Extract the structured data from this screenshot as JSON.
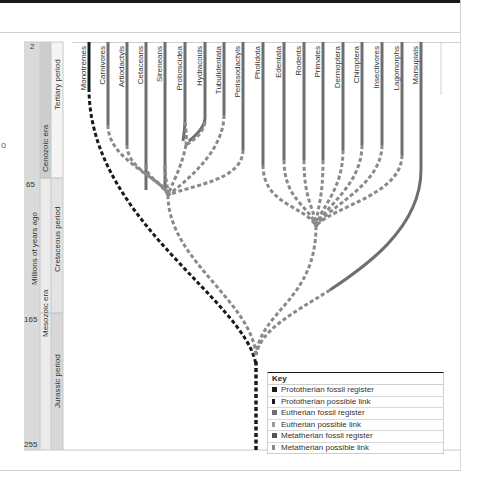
{
  "figure": {
    "side_mark": "o",
    "timeline": {
      "axis_title": "Millions of years ago",
      "ticks": [
        "2",
        "65",
        "165",
        "255"
      ],
      "eras": [
        {
          "name": "Cenozoic era"
        },
        {
          "name": "Mesozoic era"
        }
      ],
      "periods": [
        {
          "name": "Tertiary period"
        },
        {
          "name": "Cretaceous period"
        },
        {
          "name": "Jurassic period"
        }
      ]
    },
    "taxa": [
      "Monotremes",
      "Carnivores",
      "Artiodactyls",
      "Cetaceans",
      "Sireneans",
      "Proboscidea",
      "Hydracoids",
      "Tubulidentata",
      "Perissodactyls",
      "Pholidota",
      "Edentata",
      "Rodents",
      "Primates",
      "Dermoptera",
      "Chiroptera",
      "Insectivores",
      "Lagomorphs",
      "Marsupials"
    ],
    "colors": {
      "prototherian": "#1a1a1a",
      "eutherian": "#6e6e6e",
      "eutherian_link": "#8a8a8a",
      "metatherian": "#6e6e6e",
      "era_band": "#d6d6d6",
      "period_band": "#e9e9e9"
    },
    "key": {
      "title": "Key",
      "items": [
        {
          "label": "Prototherian fossil register",
          "color": "#1a1a1a"
        },
        {
          "label": "Prototherian possible link",
          "color": "#1a1a1a"
        },
        {
          "label": "Eutherian fossil register",
          "color": "#6e6e6e"
        },
        {
          "label": "Eutherian possible link",
          "color": "#9a9a9a"
        },
        {
          "label": "Metatherian fossil register",
          "color": "#555555"
        },
        {
          "label": "Metatherian possible link",
          "color": "#8a8a8a"
        }
      ]
    }
  }
}
